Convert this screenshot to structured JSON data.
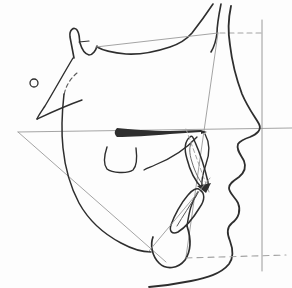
{
  "figure": {
    "kind": "cephalometric-tracing",
    "canvas": {
      "width": 292,
      "height": 288
    },
    "colors": {
      "background": "#fdfdfd",
      "ink": "#2e2e2e",
      "ink_light": "#5a5a5a",
      "reference": "#9a9a9a",
      "dashed": "#a3a3a3"
    },
    "elements": [
      {
        "name": "sella-turcica-outline",
        "type": "path",
        "d": "M 74,58 L 70,37 C 69,30 74,26 77,30 C 80,34 79,39 80,43 C 82,50 85,54 89,55 C 93,55 96,50 97,46",
        "stroke": "ink",
        "width": 1.6
      },
      {
        "name": "clinoid-tick",
        "type": "path",
        "d": "M 79,42 L 89,41",
        "stroke": "ink",
        "width": 1.2
      },
      {
        "name": "cranial-base-outline",
        "type": "path",
        "d": "M 97,47 C 104,51 114,53 126,54 C 142,55 158,51 170,47 C 179,44 186,40 192,33 C 199,24 207,13 213,4",
        "stroke": "ink",
        "width": 1.6
      },
      {
        "name": "frontal-nasal-bone-outline",
        "type": "path",
        "d": "M 221,4 C 219,14 217,24 217,33 C 216,42 214,47 211,52",
        "stroke": "ink",
        "width": 1.6
      },
      {
        "name": "sella-nasion-line",
        "type": "path",
        "d": "M 96,47 L 218,33",
        "stroke": "reference",
        "width": 0.9
      },
      {
        "name": "nasion-dashed-line",
        "type": "path",
        "d": "M 220,33 L 261,33",
        "stroke": "dashed",
        "width": 1.1,
        "dash": "5,4"
      },
      {
        "name": "vertical-reference-line",
        "type": "path",
        "d": "M 262,20 L 262,271",
        "stroke": "reference",
        "width": 1.0
      },
      {
        "name": "palatal-plane-line",
        "type": "path",
        "d": "M 18,132 L 292,128",
        "stroke": "reference",
        "width": 0.9
      },
      {
        "name": "mandibular-plane-line",
        "type": "path",
        "d": "M 18,132 L 166,262",
        "stroke": "reference",
        "width": 0.9
      },
      {
        "name": "facial-plane-line",
        "type": "path",
        "d": "M 218,33 L 186,257",
        "stroke": "reference",
        "width": 0.9
      },
      {
        "name": "soft-tissue-profile",
        "type": "path",
        "d": "M 231,6 C 228,20 228,33 230,45 C 232,62 236,78 242,94 C 248,108 255,117 259,124 C 262,130 257,134 250,137 C 244,139 240,141 238,144 C 236,150 241,155 244,161 C 246,166 245,172 239,177 C 233,181 229,184 229,188 C 229,193 235,197 238,203 C 241,210 239,218 232,223 C 227,227 227,234 230,241 C 233,249 234,257 229,264 C 221,274 206,278 191,281 C 176,284 161,286 149,287",
        "stroke": "ink",
        "width": 1.8
      },
      {
        "name": "pterygoid-line",
        "type": "path",
        "d": "M 73,58 C 64,73 54,91 45,106 C 41,112 38,116 37,119",
        "stroke": "ink",
        "width": 1.4
      },
      {
        "name": "key-ridge-line",
        "type": "path",
        "d": "M 37,119 C 50,113 65,106 82,100",
        "stroke": "ink",
        "width": 1.4
      },
      {
        "name": "sella-dashed-arc",
        "type": "path",
        "d": "M 77,73 C 70,79 65,87 64,96",
        "stroke": "ink_light",
        "width": 1.1,
        "dash": "4,3"
      },
      {
        "name": "porion-landmark-circle",
        "type": "circle",
        "cx": 34,
        "cy": 83,
        "r": 4,
        "stroke": "ink",
        "width": 1.3
      },
      {
        "name": "ramus-mandible-border",
        "type": "path",
        "d": "M 64,94 C 62,112 61,130 63,148 C 65,168 70,186 79,203 C 89,221 104,234 121,243 C 132,249 143,252 151,252",
        "stroke": "ink",
        "width": 1.5
      },
      {
        "name": "symphysis-outline",
        "type": "path",
        "d": "M 187,226 C 191,238 191,251 185,260 C 178,269 166,270 159,263 C 152,256 150,245 153,237",
        "stroke": "ink",
        "width": 1.7
      },
      {
        "name": "b-point-outline",
        "type": "path",
        "d": "M 198,192 C 191,202 189,213 187,226",
        "stroke": "ink",
        "width": 1.5
      },
      {
        "name": "palate-filled-blob",
        "type": "path",
        "d": "M 117,128 C 114,131 114,134 117,137 C 130,137 150,136 170,134 L 201,132 L 201,130 L 170,131 C 150,131 130,129 117,128 Z",
        "fill": "ink",
        "stroke": "none",
        "width": 0
      },
      {
        "name": "anterior-nasal-spine-tip",
        "type": "path",
        "d": "M 201,130 L 207,132 L 201,134 Z",
        "fill": "ink",
        "stroke": "none",
        "width": 0
      },
      {
        "name": "maxillary-alveolar-curve",
        "type": "path",
        "d": "M 197,137 C 185,150 170,159 155,165 C 151,167 147,168 144,170",
        "stroke": "ink",
        "width": 1.3
      },
      {
        "name": "molar-outline",
        "type": "path",
        "d": "M 107,147 C 104,156 103,164 107,169 C 112,173 127,174 133,170 C 137,166 137,156 136,148",
        "stroke": "ink",
        "width": 1.4
      },
      {
        "name": "maxilla-anterior-outline",
        "type": "path",
        "d": "M 205,134 C 210,143 210,153 206,164 C 203,173 201,181 202,188",
        "stroke": "ink",
        "width": 1.4
      },
      {
        "name": "upper-incisor-outline",
        "type": "path",
        "d": "M 190,137 C 185,141 184,149 187,159 C 190,171 196,182 202,188 C 206,192 209,189 208,182 C 205,169 199,151 195,142 C 193,137 192,135 190,137 Z",
        "stroke": "ink",
        "width": 1.5
      },
      {
        "name": "upper-incisor-inner-line",
        "type": "path",
        "d": "M 192,141 C 189,146 189,153 192,162 C 195,172 199,180 203,185",
        "stroke": "ink_light",
        "width": 0.9
      },
      {
        "name": "upper-incisor-axis-dashed",
        "type": "path",
        "d": "M 186,129 L 209,192",
        "stroke": "dashed",
        "width": 1.0,
        "dash": "4,3"
      },
      {
        "name": "incisal-overlap-mark",
        "type": "path",
        "d": "M 197,186 L 211,183 L 206,193 Z",
        "fill": "ink",
        "stroke": "none",
        "width": 0
      },
      {
        "name": "lower-incisor-outline",
        "type": "path",
        "d": "M 200,190 C 205,193 205,200 200,207 C 194,217 186,227 178,232 C 172,235 169,231 171,225 C 174,216 181,203 188,195 C 192,190 197,187 200,190 Z",
        "stroke": "ink",
        "width": 1.5
      },
      {
        "name": "lower-incisor-inner-line",
        "type": "path",
        "d": "M 196,196 C 190,205 183,216 177,226",
        "stroke": "ink_light",
        "width": 1.0
      },
      {
        "name": "lower-incisor-axis-line",
        "type": "path",
        "d": "M 210,178 L 149,251",
        "stroke": "reference",
        "width": 0.9
      },
      {
        "name": "bottom-dashed-line",
        "type": "path",
        "d": "M 186,258 L 286,255",
        "stroke": "dashed",
        "width": 1.1,
        "dash": "6,5"
      }
    ]
  }
}
